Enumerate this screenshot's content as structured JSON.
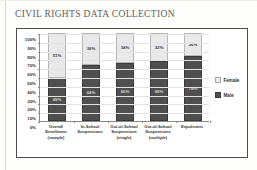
{
  "document": {
    "title": "CIVIL RIGHTS DATA COLLECTION"
  },
  "chart_data": {
    "type": "bar",
    "subtype": "stacked-100-percent",
    "title": "",
    "xlabel": "",
    "ylabel": "",
    "ylim": [
      0,
      100
    ],
    "ytick_labels": [
      "100%",
      "90%",
      "80%",
      "70%",
      "60%",
      "50%",
      "40%",
      "30%",
      "20%",
      "10%",
      "0%"
    ],
    "ytick_values": [
      100,
      90,
      80,
      70,
      60,
      50,
      40,
      30,
      20,
      10,
      0
    ],
    "grid": true,
    "legend_position": "right",
    "categories": [
      "Overall Enrollment (sample)",
      "In-School Suspensions",
      "Out-of-School Suspensions (single)",
      "Out-of-School Suspensions (multiple)",
      "Expulsions"
    ],
    "category_lines": [
      [
        "Overall",
        "Enrollment",
        "(sample)"
      ],
      [
        "In-School",
        "Suspensions"
      ],
      [
        "Out-of-School",
        "Suspensions",
        "(single)"
      ],
      [
        "Out-of-School",
        "Suspensions",
        "(multiple)"
      ],
      [
        "Expulsions"
      ]
    ],
    "series": [
      {
        "name": "Male",
        "color": "#4f4f4f",
        "values": [
          49,
          64,
          66,
          68,
          74
        ],
        "labels": [
          "49%",
          "64%",
          "66%",
          "68%",
          "74%"
        ]
      },
      {
        "name": "Female",
        "color": "#e9e9e9",
        "values": [
          51,
          36,
          34,
          32,
          26
        ],
        "labels": [
          "51%",
          "36%",
          "34%",
          "32%",
          "26%"
        ]
      }
    ],
    "legend": [
      {
        "label": "Female",
        "color": "#e9e9e9"
      },
      {
        "label": "Male",
        "color": "#4f4f4f"
      }
    ]
  }
}
